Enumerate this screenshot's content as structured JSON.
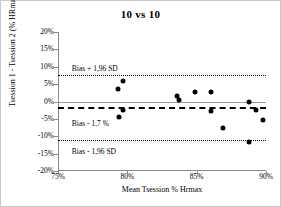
{
  "chart_data": {
    "type": "scatter",
    "title": "10 vs 10",
    "xlabel": "Mean Tsession % Hrmax",
    "ylabel": "Tsession 1 - Tsession 2 (%  HRmax)",
    "xlim": [
      75,
      90
    ],
    "ylim": [
      -20,
      20
    ],
    "grid": false,
    "legend": "none",
    "xticks": [
      "75%",
      "80%",
      "85%",
      "90%"
    ],
    "xtick_values": [
      75,
      80,
      85,
      90
    ],
    "yticks": [
      "20%",
      "15%",
      "10%",
      "5%",
      "0%",
      "-5%",
      "-10%",
      "-15%",
      "-20%"
    ],
    "ytick_values": [
      20,
      15,
      10,
      5,
      0,
      -5,
      -10,
      -15,
      -20
    ],
    "reference_lines": [
      {
        "name": "zero",
        "value": 0,
        "style": "solid",
        "label": ""
      },
      {
        "name": "bias",
        "value": -1.7,
        "style": "dashed",
        "label": "Bias - 1,7 %"
      },
      {
        "name": "upper-loa",
        "value": 7.7,
        "style": "dotted",
        "label": "Bias + 1,96 SD"
      },
      {
        "name": "lower-loa",
        "value": -11.0,
        "style": "dotted",
        "label": "Bias - 1,96 SD"
      }
    ],
    "annotations": [
      {
        "text": "Bias + 1,96 SD",
        "x": 76.0,
        "y": 10.6
      },
      {
        "text": "Bias - 1,7 %",
        "x": 76.0,
        "y": -5.3
      },
      {
        "text": "Bias - 1,96 SD",
        "x": 76.0,
        "y": -13.5
      }
    ],
    "points": [
      {
        "x": 79.3,
        "y": 3.7
      },
      {
        "x": 79.7,
        "y": 5.8
      },
      {
        "x": 79.4,
        "y": -4.6
      },
      {
        "x": 79.7,
        "y": -2.4
      },
      {
        "x": 83.6,
        "y": 1.7
      },
      {
        "x": 83.7,
        "y": 0.5
      },
      {
        "x": 84.9,
        "y": 2.7
      },
      {
        "x": 86.0,
        "y": 2.8
      },
      {
        "x": 86.0,
        "y": -2.6
      },
      {
        "x": 86.9,
        "y": -7.6
      },
      {
        "x": 88.8,
        "y": -11.7
      },
      {
        "x": 88.8,
        "y": 0.0
      },
      {
        "x": 89.3,
        "y": -2.5
      },
      {
        "x": 89.8,
        "y": -5.3
      }
    ]
  }
}
